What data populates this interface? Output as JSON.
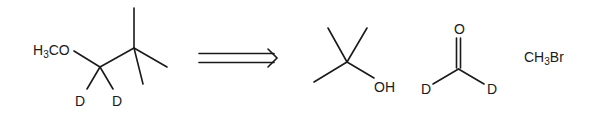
{
  "diagram": {
    "type": "retrosynthesis",
    "target": {
      "label_left": "H3CO",
      "label_parts": {
        "a": "H",
        "sub": "3",
        "b": "CO"
      },
      "deuterium_labels": [
        "D",
        "D"
      ],
      "name": "1-methoxy-2,2-dimethylpropane-1,1-d2"
    },
    "arrow": {
      "type": "retrosynthetic-double-arrow"
    },
    "precursors": [
      {
        "name": "tert-butanol",
        "labels": {
          "hydroxyl": "OH"
        }
      },
      {
        "name": "formaldehyde-d2",
        "labels": {
          "oxygen": "O",
          "deuterium_left": "D",
          "deuterium_right": "D"
        }
      },
      {
        "name": "bromomethane",
        "label_parts": {
          "a": "CH",
          "sub": "3",
          "b": "Br"
        }
      }
    ]
  }
}
